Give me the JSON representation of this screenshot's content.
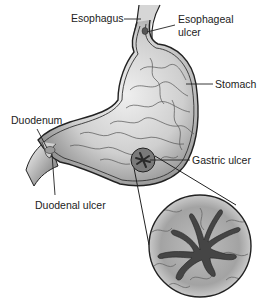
{
  "diagram": {
    "labels": {
      "esophagus": "Esophagus",
      "esophageal_ulcer_line1": "Esophageal",
      "esophageal_ulcer_line2": "ulcer",
      "stomach": "Stomach",
      "duodenum": "Duodenum",
      "gastric_ulcer": "Gastric ulcer",
      "duodenal_ulcer": "Duodenal ulcer"
    },
    "colors": {
      "outline": "#222222",
      "tissue_light": "#e6e6e6",
      "tissue_mid": "#a8a8a8",
      "ulcer_dark": "#4a4a4a"
    }
  }
}
